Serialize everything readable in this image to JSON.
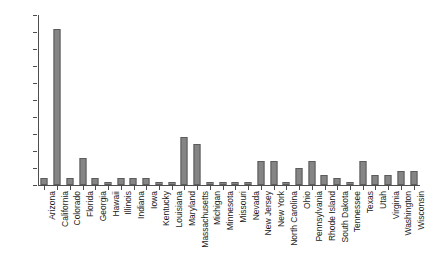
{
  "chart_data": {
    "type": "bar",
    "title": "",
    "subtitle": "",
    "xlabel": "",
    "ylabel": "",
    "ylim": [
      0,
      50
    ],
    "yticks": [
      0,
      5,
      10,
      15,
      20,
      25,
      30,
      35,
      40,
      45,
      50
    ],
    "grid": false,
    "legend": null,
    "bar_color": "#858585",
    "bar_edge_color": "#5c5c5c",
    "axis_color": "#4d4d4d",
    "categories": [
      "Arizona",
      "California",
      "Colorado",
      "Florida",
      "Georgia",
      "Hawaii",
      "Illinois",
      "Indiana",
      "Iowa",
      "Kentucky",
      "Louisiana",
      "Maryland",
      "Massachusetts",
      "Michigan",
      "Minnesota",
      "Missouri",
      "Nevada",
      "New Jersey",
      "New York",
      "North Carolina",
      "Ohio",
      "Pennsylvania",
      "Rhode Island",
      "South Dakota",
      "Tennessee",
      "Texas",
      "Utah",
      "Virginia",
      "Washington",
      "Wisconsin"
    ],
    "values": [
      2,
      46,
      2,
      8,
      2,
      1,
      2,
      2,
      2,
      1,
      1,
      14,
      12,
      1,
      1,
      1,
      1,
      7,
      7,
      1,
      5,
      7,
      3,
      2,
      1,
      7,
      3,
      3,
      4,
      4
    ]
  }
}
